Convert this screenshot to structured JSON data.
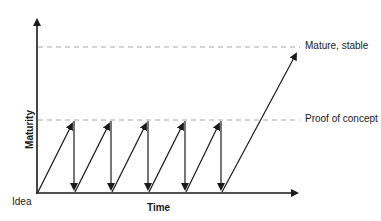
{
  "diagram": {
    "y_axis_label": "Maturity",
    "x_axis_label": "Time",
    "origin_label": "Idea",
    "levels": [
      {
        "label": "Mature, stable",
        "y": 47
      },
      {
        "label": "Proof of concept",
        "y": 120
      }
    ],
    "iterations": 5,
    "colors": {
      "line": "#1a1a1a",
      "dashed": "#a0a0a0",
      "text": "#1a1a1a"
    }
  }
}
